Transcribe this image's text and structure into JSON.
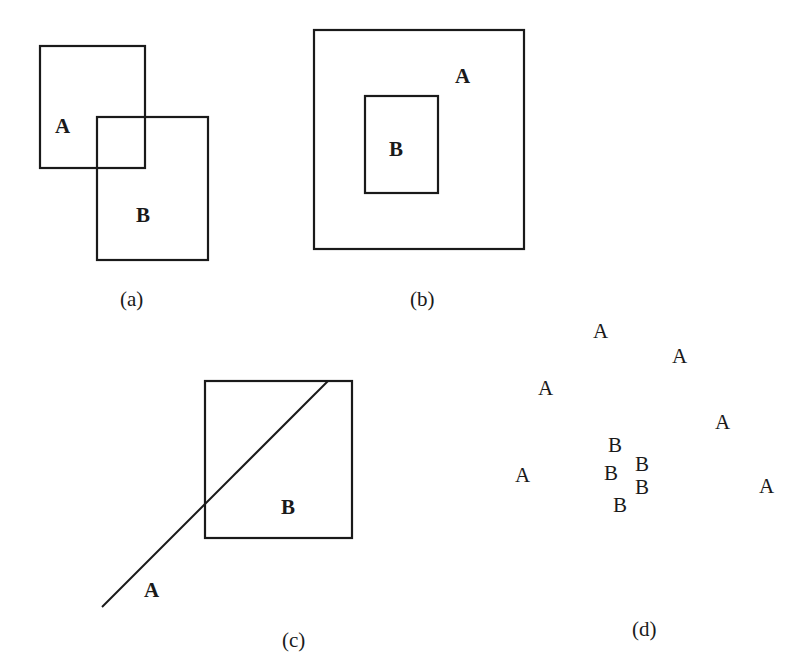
{
  "figure": {
    "panels": [
      {
        "id": "a",
        "caption": "(a)",
        "description": "Two overlapping rectangles",
        "label_a": "A",
        "label_b": "B"
      },
      {
        "id": "b",
        "caption": "(b)",
        "description": "Rectangle B contained inside rectangle A",
        "label_a": "A",
        "label_b": "B"
      },
      {
        "id": "c",
        "caption": "(c)",
        "description": "Line A crossing rectangle B",
        "label_a": "A",
        "label_b": "B"
      },
      {
        "id": "d",
        "caption": "(d)",
        "description": "Cluster of B points surrounded by scattered A points",
        "points_a": [
          "A",
          "A",
          "A",
          "A",
          "A",
          "A"
        ],
        "points_b": [
          "B",
          "B",
          "B",
          "B",
          "B"
        ]
      }
    ]
  }
}
